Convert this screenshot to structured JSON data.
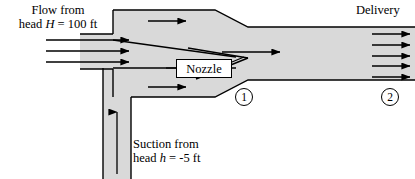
{
  "figure": {
    "type": "ejector-jet-pump-schematic",
    "title": "",
    "fill_color": "#d9d9d9",
    "line_color": "#000000",
    "background": "#ffffff"
  },
  "labels": {
    "flow_line1": "Flow from",
    "flow_line2_prefix": "head ",
    "flow_var": "H",
    "flow_line2_suffix": " = 100 ft",
    "suction_line1": "Suction from",
    "suction_line2_prefix": "head ",
    "suction_var": "h",
    "suction_line2_suffix": " = -5 ft",
    "delivery": "Delivery",
    "nozzle": "Nozzle"
  },
  "stations": [
    {
      "id": "station-1",
      "label": "1"
    },
    {
      "id": "station-2",
      "label": "2"
    }
  ],
  "values": {
    "driving_head_ft": 100,
    "suction_head_ft": -5
  },
  "arrows": {
    "inlet_count": 3,
    "delivery_count": 5,
    "chamber_top_count": 1,
    "chamber_bottom_count": 1,
    "throat_count": 1,
    "suction_count": 1
  }
}
